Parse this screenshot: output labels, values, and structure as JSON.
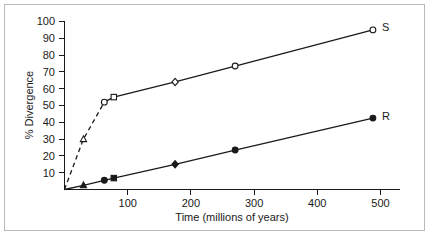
{
  "chart_data": {
    "type": "line",
    "title": "",
    "xlabel": "Time (millions of years)",
    "ylabel": "% Divergence",
    "xlim": [
      0,
      520
    ],
    "ylim": [
      0,
      100
    ],
    "xticks": [
      100,
      200,
      300,
      400,
      500
    ],
    "yticks": [
      10,
      20,
      30,
      40,
      50,
      60,
      70,
      80,
      90,
      100
    ],
    "grid": false,
    "legend_position": "right-inline-end-of-line",
    "series": [
      {
        "name": "S",
        "label": "S",
        "marker_style": "open",
        "color": "#1a1a1a",
        "points": [
          {
            "x": 0,
            "y": 0,
            "marker": "none"
          },
          {
            "x": 30,
            "y": 30,
            "marker": "triangle"
          },
          {
            "x": 63,
            "y": 52,
            "marker": "circle"
          },
          {
            "x": 78,
            "y": 55,
            "marker": "square"
          },
          {
            "x": 175,
            "y": 64,
            "marker": "diamond"
          },
          {
            "x": 270,
            "y": 73.5,
            "marker": "circle"
          },
          {
            "x": 488,
            "y": 95,
            "marker": "circle"
          }
        ],
        "dashed_through_index": 2
      },
      {
        "name": "R",
        "label": "R",
        "marker_style": "filled",
        "color": "#1a1a1a",
        "points": [
          {
            "x": 0,
            "y": 0,
            "marker": "none"
          },
          {
            "x": 30,
            "y": 2.5,
            "marker": "triangle"
          },
          {
            "x": 63,
            "y": 5.5,
            "marker": "circle"
          },
          {
            "x": 78,
            "y": 6.8,
            "marker": "square"
          },
          {
            "x": 175,
            "y": 15,
            "marker": "diamond"
          },
          {
            "x": 270,
            "y": 23.5,
            "marker": "circle"
          },
          {
            "x": 488,
            "y": 42.5,
            "marker": "circle"
          }
        ],
        "dashed_through_index": 0
      }
    ]
  }
}
